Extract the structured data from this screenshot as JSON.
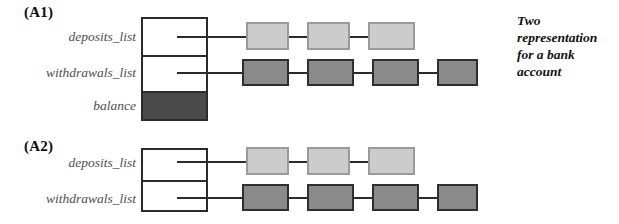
{
  "figure": {
    "side_note_lines": [
      "Two",
      "representation",
      "for a bank",
      "account"
    ]
  },
  "panels": [
    {
      "caption": "(A1)",
      "fields": [
        {
          "label": "deposits_list",
          "filled": false
        },
        {
          "label": "withdrawals_list",
          "filled": false
        },
        {
          "label": "balance",
          "filled": true
        }
      ],
      "chains": [
        {
          "name": "deposits-chain",
          "style": "light",
          "node_count": 3
        },
        {
          "name": "withdrawals-chain",
          "style": "dark",
          "node_count": 4
        }
      ]
    },
    {
      "caption": "(A2)",
      "fields": [
        {
          "label": "deposits_list",
          "filled": false
        },
        {
          "label": "withdrawals_list",
          "filled": false
        }
      ],
      "chains": [
        {
          "name": "deposits-chain",
          "style": "light",
          "node_count": 3
        },
        {
          "name": "withdrawals-chain",
          "style": "dark",
          "node_count": 4
        }
      ]
    }
  ],
  "colors": {
    "light_node_fill": "#cccccc",
    "light_node_border": "#9a9a9a",
    "dark_node_fill": "#8a8a8a",
    "dark_node_border": "#2f2f2f",
    "filled_cell": "#4a4a4a",
    "line": "#2b2b2b",
    "label_text": "#4e4e4e",
    "background": "#ffffff"
  }
}
